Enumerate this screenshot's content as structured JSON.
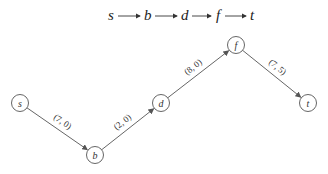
{
  "path": {
    "nodes": [
      "s",
      "b",
      "d",
      "f",
      "t"
    ]
  },
  "graph": {
    "nodes": [
      {
        "id": "s",
        "label": "s",
        "x": 20,
        "y": 103
      },
      {
        "id": "b",
        "label": "b",
        "x": 95,
        "y": 155
      },
      {
        "id": "d",
        "label": "d",
        "x": 161,
        "y": 103
      },
      {
        "id": "f",
        "label": "f",
        "x": 236,
        "y": 45
      },
      {
        "id": "t",
        "label": "t",
        "x": 308,
        "y": 103
      }
    ],
    "edges": [
      {
        "from": "s",
        "to": "b",
        "label": "(7, 0)"
      },
      {
        "from": "b",
        "to": "d",
        "label": "(2, 0)"
      },
      {
        "from": "d",
        "to": "f",
        "label": "(8, 0)"
      },
      {
        "from": "f",
        "to": "t",
        "label": "(7, 5)"
      }
    ]
  },
  "colors": {
    "stroke": "#666666",
    "text": "#222222",
    "background": "#ffffff"
  }
}
